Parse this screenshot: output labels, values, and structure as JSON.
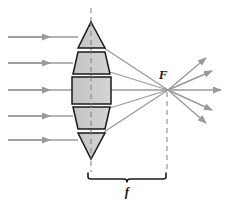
{
  "figure": {
    "labels": {
      "focal_point": "F",
      "focal_length": "f"
    },
    "colors": {
      "ray": "#9a9a9a",
      "ray_arrow": "#9a9a9a",
      "prism_fill": "#c9c9c9",
      "prism_fill_light": "#d8d8d8",
      "prism_stroke": "#1a1a1a",
      "axis_dash": "#8c8c8c",
      "bracket": "#1a1a1a",
      "label_text": "#1a1a1a",
      "background": "#ffffff"
    },
    "geometry": {
      "focal_point_xy": [
        168,
        90
      ],
      "optical_axis_x": 91,
      "bracket_y": 178,
      "bracket_x_start": 88,
      "bracket_x_end": 166
    },
    "incoming_rays": [
      {
        "name": "ray-1",
        "y": 37,
        "x_start": 8,
        "x_end": 78,
        "arrow_x": 46
      },
      {
        "name": "ray-2",
        "y": 63,
        "x_start": 8,
        "x_end": 72,
        "arrow_x": 46
      },
      {
        "name": "ray-3",
        "y": 90,
        "x_start": 8,
        "x_end": 70,
        "arrow_x": 46
      },
      {
        "name": "ray-4",
        "y": 116,
        "x_start": 8,
        "x_end": 72,
        "arrow_x": 46
      },
      {
        "name": "ray-5",
        "y": 140,
        "x_start": 8,
        "x_end": 78,
        "arrow_x": 46
      }
    ],
    "refracted_rays": [
      {
        "name": "refracted-ray-1",
        "from": [
          104,
          48
        ],
        "to": [
          168,
          90
        ]
      },
      {
        "name": "refracted-ray-2",
        "from": [
          110,
          72
        ],
        "to": [
          168,
          90
        ]
      },
      {
        "name": "refracted-ray-3",
        "from": [
          112,
          90
        ],
        "to": [
          168,
          90
        ]
      },
      {
        "name": "refracted-ray-4",
        "from": [
          110,
          108
        ],
        "to": [
          168,
          90
        ]
      },
      {
        "name": "refracted-ray-5",
        "from": [
          104,
          132
        ],
        "to": [
          168,
          90
        ]
      }
    ],
    "diverging_rays": [
      {
        "name": "diverging-ray-1",
        "from": [
          168,
          90
        ],
        "to": [
          208,
          57
        ]
      },
      {
        "name": "diverging-ray-2",
        "from": [
          168,
          90
        ],
        "to": [
          214,
          70
        ]
      },
      {
        "name": "diverging-ray-3",
        "from": [
          168,
          90
        ],
        "to": [
          222,
          90
        ]
      },
      {
        "name": "diverging-ray-4",
        "from": [
          168,
          90
        ],
        "to": [
          214,
          111
        ]
      },
      {
        "name": "diverging-ray-5",
        "from": [
          168,
          90
        ],
        "to": [
          208,
          122
        ]
      }
    ],
    "prisms": [
      {
        "name": "prism-top-triangle",
        "shape": "triangle-up",
        "points": "91,22 105,48 78,48"
      },
      {
        "name": "prism-upper-trapezoid",
        "shape": "trapezoid-down",
        "points": "78,52 105,52 110,74 73,74"
      },
      {
        "name": "prism-center-rectangle",
        "shape": "rectangle",
        "points": "72,77 111,77 111,104 72,104"
      },
      {
        "name": "prism-lower-trapezoid",
        "shape": "trapezoid-up",
        "points": "73,107 110,107 105,129 78,129"
      },
      {
        "name": "prism-bottom-triangle",
        "shape": "triangle-down",
        "points": "78,133 105,133 91,159"
      }
    ]
  }
}
